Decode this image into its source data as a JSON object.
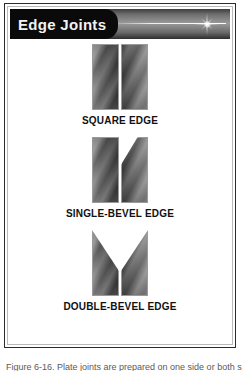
{
  "header": {
    "title": "Edge Joints",
    "sparkle_icon": "sparkle-icon",
    "streak_icon": "light-streak"
  },
  "figures": [
    {
      "id": "square-edge",
      "caption": "SQUARE EDGE",
      "left_piece": "square-plate",
      "right_piece": "square-plate",
      "groove": "none"
    },
    {
      "id": "single-bevel-edge",
      "caption": "SINGLE-BEVEL EDGE",
      "left_piece": "square-plate",
      "right_piece": "bevelled-plate",
      "groove": "single-bevel"
    },
    {
      "id": "double-bevel-edge",
      "caption": "DOUBLE-BEVEL EDGE",
      "left_piece": "bevelled-plate",
      "right_piece": "bevelled-plate",
      "groove": "v-groove"
    }
  ],
  "figure_caption": {
    "text": "Figure 6-16. Plate joints are prepared on one side or both sides."
  },
  "colors": {
    "banner_dark": "#2e2e2e",
    "banner_light": "#9a9a9a",
    "tab_background": "#0a0a0a",
    "tab_text": "#f2f2f2",
    "caption_text": "#111111",
    "border_outer": "#2b2b2b",
    "border_inner": "#b9b9b9"
  }
}
